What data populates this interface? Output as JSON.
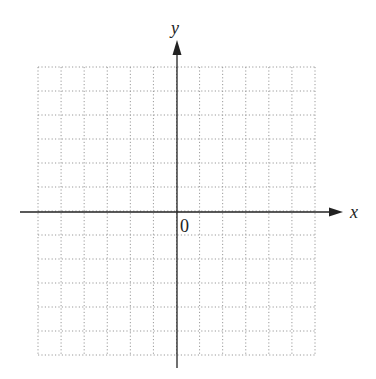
{
  "diagram": {
    "type": "coordinate-plane",
    "x_axis_label": "x",
    "y_axis_label": "y",
    "origin_label": "0",
    "grid": {
      "columns": 12,
      "rows": 12,
      "style": "dotted",
      "color": "#9a9a9a"
    },
    "axis_color": "#222222"
  }
}
